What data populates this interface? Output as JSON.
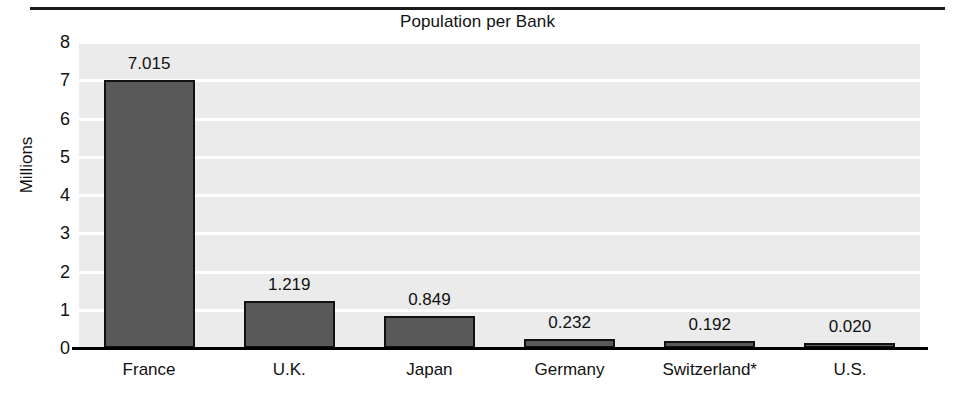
{
  "chart_data": {
    "type": "bar",
    "title": "Population per Bank",
    "xlabel": "",
    "ylabel": "Millions",
    "ylim": [
      0,
      8
    ],
    "yticks": [
      "0",
      "1",
      "2",
      "3",
      "4",
      "5",
      "6",
      "7",
      "8"
    ],
    "grid": true,
    "legend": "none",
    "categories": [
      "France",
      "U.K.",
      "Japan",
      "Germany",
      "Switzerland*",
      "U.S."
    ],
    "values": [
      7.015,
      1.219,
      0.849,
      0.232,
      0.192,
      0.02
    ],
    "value_labels": [
      "7.015",
      "1.219",
      "0.849",
      "0.232",
      "0.192",
      "0.020"
    ],
    "bar_color": "#595959",
    "bar_edge_color": "#111111",
    "plot_background": "#ebebeb",
    "gridline_color": "#ffffff",
    "footnote_marker": "*"
  }
}
